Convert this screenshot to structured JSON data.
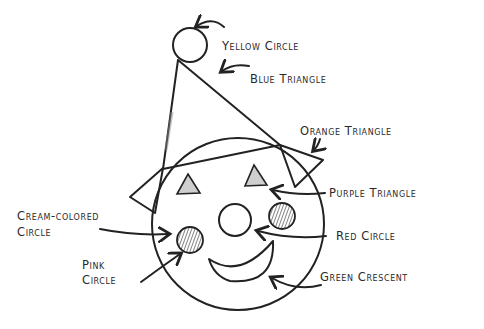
{
  "diagram": {
    "labels": {
      "yellow_circle": "Yellow Circle",
      "blue_triangle": "Blue Triangle",
      "orange_triangle": "Orange Triangle",
      "purple_triangle": "Purple Triangle",
      "cream_circle_line1": "Cream-colored",
      "cream_circle_line2": "Circle",
      "red_circle": "Red Circle",
      "pink_circle_line1": "Pink",
      "pink_circle_line2": "Circle",
      "green_crescent": "Green Crescent"
    },
    "shapes": [
      {
        "name": "Yellow Circle",
        "part": "pompom"
      },
      {
        "name": "Blue Triangle",
        "part": "hat"
      },
      {
        "name": "Orange Triangle",
        "part": "ear"
      },
      {
        "name": "Purple Triangle",
        "part": "eye"
      },
      {
        "name": "Cream-colored Circle",
        "part": "face"
      },
      {
        "name": "Red Circle",
        "part": "nose"
      },
      {
        "name": "Pink Circle",
        "part": "cheek"
      },
      {
        "name": "Green Crescent",
        "part": "mouth"
      }
    ]
  }
}
